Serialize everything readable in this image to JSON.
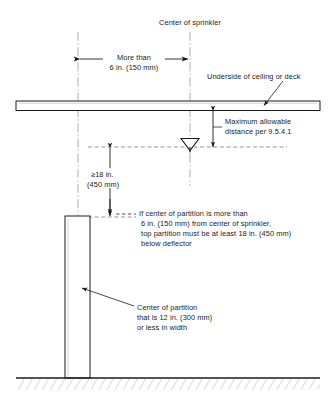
{
  "figure": {
    "colors": {
      "line": "#1a1a1a",
      "construction_line": "#8a8a8a",
      "text": "#1a1a1a",
      "background": "#ffffff"
    },
    "labels": {
      "center_of_sprinkler": "Center of sprinkler",
      "more_than_line1": "More than",
      "more_than_line2": "6 in. (150 mm)",
      "underside_of_ceiling": "Underside of ceiling or deck",
      "max_distance_line1": "Maximum allowable",
      "max_distance_line2": "distance per 9.5.4.1",
      "min_18_line1": "≥18 in.",
      "min_18_line2": "(450 mm)",
      "partition_note_line1": "If center of partition is more than",
      "partition_note_line2": "6 in. (150 mm) from center of sprinkler,",
      "partition_note_line3": "top partition must be at least 18 in. (450 mm)",
      "partition_note_line4": "below deflector",
      "center_partition_line1": "Center of partition",
      "center_partition_line2": "that is 12 in. (300 mm)",
      "center_partition_line3": "or less in width"
    },
    "elements": {
      "ceiling_deck": "ceiling-deck-band",
      "sprinkler_deflector": "sprinkler-deflector-symbol",
      "partition": "partition-wall",
      "floor": "floor-hatching",
      "sprinkler_centerline": "sprinkler-centerline",
      "partition_centerline": "partition-centerline",
      "deflector_level": "deflector-level-line",
      "partition_top_level": "partition-top-level-line"
    },
    "dimensions": {
      "horizontal_clearance": "More than 6 in. (150 mm)",
      "vertical_below_deflector": "≥18 in. (450 mm)",
      "deflector_to_ceiling": "Maximum allowable distance per 9.5.4.1",
      "partition_width": "12 in. (300 mm) or less"
    }
  }
}
